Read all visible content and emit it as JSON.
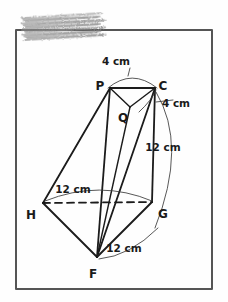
{
  "page": {
    "background_color": "#fefefe",
    "ink_color": "#1a1a1a",
    "width": 228,
    "height": 302
  },
  "redaction": {
    "present": true,
    "kind": "pencil-scribble-redaction",
    "color": "#8f8f8f",
    "x": 22,
    "y": 14,
    "width": 83,
    "height": 26,
    "rotation_deg": -3
  },
  "frame": {
    "name": "page-border",
    "x": 16,
    "y": 30,
    "width": 196,
    "height": 259,
    "stroke_color": "#555555",
    "stroke_width": 2
  },
  "figure": {
    "name": "frustum-pyramid-solid",
    "vertices": [
      {
        "id": "P",
        "label": "P",
        "x": 110,
        "y": 88,
        "label_x": 100,
        "label_y": 86
      },
      {
        "id": "C",
        "label": "C",
        "x": 155,
        "y": 88,
        "label_x": 163,
        "label_y": 86
      },
      {
        "id": "Q",
        "label": "Q",
        "x": 130,
        "y": 107,
        "label_x": 123,
        "label_y": 118
      },
      {
        "id": "H",
        "label": "H",
        "x": 43,
        "y": 203,
        "label_x": 31,
        "label_y": 215
      },
      {
        "id": "G",
        "label": "G",
        "x": 152,
        "y": 202,
        "label_x": 163,
        "label_y": 214
      },
      {
        "id": "F",
        "label": "F",
        "x": 97,
        "y": 257,
        "label_x": 93,
        "label_y": 274
      }
    ],
    "edges": [
      {
        "id": "PC",
        "from": "P",
        "to": "C",
        "style": "solid",
        "weight": 1.8
      },
      {
        "id": "PQ",
        "from": "P",
        "to": "Q",
        "style": "solid",
        "weight": 1.4
      },
      {
        "id": "QC",
        "from": "Q",
        "to": "C",
        "style": "solid",
        "weight": 1.4
      },
      {
        "id": "PH",
        "from": "P",
        "to": "H",
        "style": "solid",
        "weight": 1.8
      },
      {
        "id": "PF",
        "from": "P",
        "to": "F",
        "style": "solid",
        "weight": 1.8
      },
      {
        "id": "CG",
        "from": "C",
        "to": "G",
        "style": "solid",
        "weight": 1.8
      },
      {
        "id": "CF",
        "from": "C",
        "to": "F",
        "style": "solid",
        "weight": 1.8
      },
      {
        "id": "QF",
        "from": "Q",
        "to": "F",
        "style": "solid",
        "weight": 1.4
      },
      {
        "id": "HG",
        "from": "H",
        "to": "G",
        "style": "dashed",
        "weight": 1.8
      },
      {
        "id": "HF",
        "from": "H",
        "to": "F",
        "style": "solid",
        "weight": 1.8
      },
      {
        "id": "GF",
        "from": "G",
        "to": "F",
        "style": "solid",
        "weight": 1.8
      }
    ]
  },
  "measurements": [
    {
      "id": "m-pc",
      "value": "4",
      "unit": "cm",
      "text": "4 cm",
      "edge": "PC",
      "label_x": 116,
      "label_y": 62,
      "arc_path": "M 108 88 Q 132 68 157 88",
      "leader_path": "M 130 68 L 128 76"
    },
    {
      "id": "m-qc",
      "value": "4",
      "unit": "cm",
      "text": "4 cm",
      "edge": "QC",
      "label_x": 176,
      "label_y": 104,
      "arc_path": "M 139 112 Q 152 100 156 90",
      "leader_path": "M 156 102 L 173 100"
    },
    {
      "id": "m-cg",
      "value": "12",
      "unit": "cm",
      "text": "12 cm",
      "edge": "CG",
      "label_x": 163,
      "label_y": 148,
      "arc_path": "M 156 92 Q 188 145 155 228",
      "leader_path": ""
    },
    {
      "id": "m-hg",
      "value": "12",
      "unit": "cm",
      "text": "12 cm",
      "edge": "HG",
      "label_x": 73,
      "label_y": 190,
      "arc_path": "M 45 201 Q 100 179 152 201",
      "leader_path": ""
    },
    {
      "id": "m-gf",
      "value": "12",
      "unit": "cm",
      "text": "12 cm",
      "edge": "GF",
      "label_x": 124,
      "label_y": 249,
      "arc_path": "M 99 259 Q 130 256 158 228",
      "leader_path": ""
    }
  ]
}
